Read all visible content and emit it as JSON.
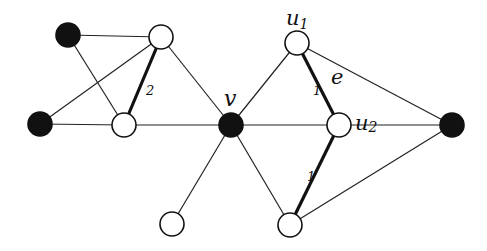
{
  "colors": {
    "filled": "#111111",
    "hollow": "#ffffff",
    "stroke": "#111111"
  },
  "nodes": [
    {
      "id": "a",
      "x": 68,
      "y": 35,
      "fill": "black",
      "label": ""
    },
    {
      "id": "b",
      "x": 161,
      "y": 37,
      "fill": "white",
      "label": ""
    },
    {
      "id": "d",
      "x": 40,
      "y": 124,
      "fill": "black",
      "label": ""
    },
    {
      "id": "c",
      "x": 124,
      "y": 125,
      "fill": "white",
      "label": ""
    },
    {
      "id": "v",
      "x": 231,
      "y": 125,
      "fill": "black",
      "label": "v"
    },
    {
      "id": "u1",
      "x": 297,
      "y": 43,
      "fill": "white",
      "label": "u1"
    },
    {
      "id": "u2",
      "x": 339,
      "y": 125,
      "fill": "white",
      "label": "u2"
    },
    {
      "id": "g",
      "x": 452,
      "y": 125,
      "fill": "black",
      "label": ""
    },
    {
      "id": "e2",
      "x": 172,
      "y": 224,
      "fill": "white",
      "label": ""
    },
    {
      "id": "f",
      "x": 290,
      "y": 225,
      "fill": "white",
      "label": ""
    }
  ],
  "edges": [
    {
      "from": "a",
      "to": "b",
      "thick": false
    },
    {
      "from": "a",
      "to": "c",
      "thick": false
    },
    {
      "from": "d",
      "to": "b",
      "thick": false
    },
    {
      "from": "d",
      "to": "c",
      "thick": false
    },
    {
      "from": "b",
      "to": "c",
      "thick": true,
      "weight": "2"
    },
    {
      "from": "b",
      "to": "v",
      "thick": false
    },
    {
      "from": "c",
      "to": "v",
      "thick": false
    },
    {
      "from": "v",
      "to": "u1",
      "thick": false
    },
    {
      "from": "v",
      "to": "u2",
      "thick": false
    },
    {
      "from": "v",
      "to": "e2",
      "thick": false
    },
    {
      "from": "v",
      "to": "f",
      "thick": false
    },
    {
      "from": "u1",
      "to": "u2",
      "thick": true,
      "weight": "1",
      "name": "e"
    },
    {
      "from": "u1",
      "to": "g",
      "thick": false
    },
    {
      "from": "u2",
      "to": "g",
      "thick": false
    },
    {
      "from": "u2",
      "to": "f",
      "thick": true,
      "weight": "1"
    },
    {
      "from": "f",
      "to": "g",
      "thick": false
    }
  ],
  "labels": {
    "v": "v",
    "u1_main": "u",
    "u1_sub": "1",
    "u2_main": "u",
    "u2_sub": "2",
    "edge_e": "e",
    "weight_bc": "2",
    "weight_u1u2": "1",
    "weight_u2f": "1"
  }
}
